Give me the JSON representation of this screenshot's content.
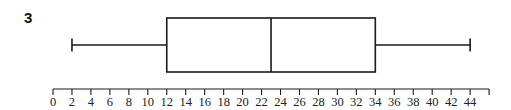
{
  "question": {
    "number": "3"
  },
  "chart_data": {
    "type": "boxplot",
    "title": "",
    "xlabel": "",
    "ylabel": "",
    "orientation": "horizontal",
    "five_number_summary": {
      "min": 2,
      "q1": 12,
      "median": 23,
      "q3": 34,
      "max": 44
    },
    "axis": {
      "range": [
        0,
        46
      ],
      "tick_step": 2,
      "tick_labels": [
        "0",
        "2",
        "4",
        "6",
        "8",
        "10",
        "12",
        "14",
        "16",
        "18",
        "20",
        "22",
        "24",
        "26",
        "28",
        "30",
        "32",
        "34",
        "36",
        "38",
        "40",
        "42",
        "44"
      ],
      "extra_ticks_unlabeled": [
        46
      ]
    },
    "grid": false,
    "legend": null,
    "colors": {
      "stroke": "#1a1a1a",
      "background": "#ffffff"
    }
  }
}
